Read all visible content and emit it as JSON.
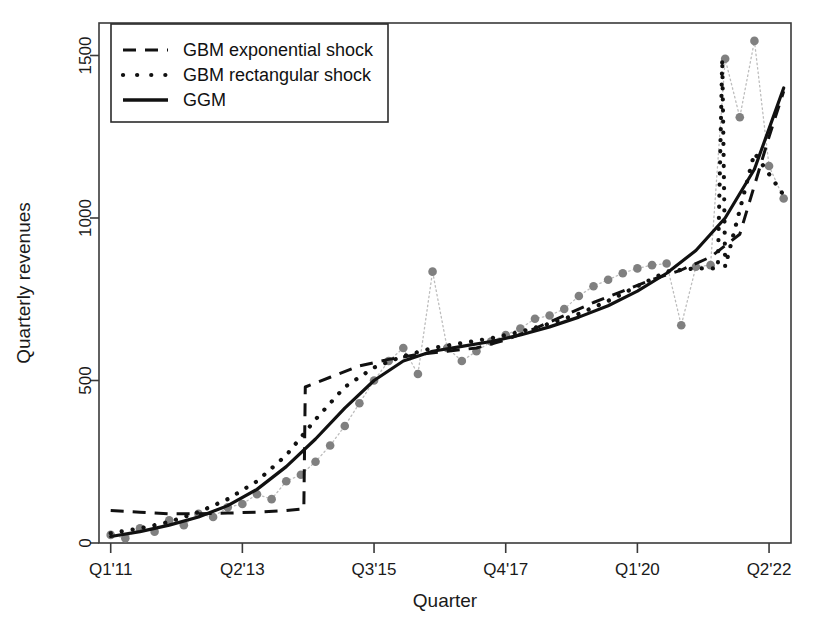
{
  "chart_data": {
    "type": "line",
    "title": "",
    "xlabel": "Quarter",
    "ylabel": "Quarterly revenues",
    "grid": false,
    "legend_position": "top-left",
    "ylim": [
      0,
      1600
    ],
    "yticks": [
      0,
      500,
      1000,
      1500
    ],
    "ytick_labels": [
      "0",
      "500",
      "1000",
      "1500"
    ],
    "xticks": [
      0,
      9,
      18,
      27,
      36,
      45
    ],
    "xtick_labels": [
      "Q1'11",
      "Q2'13",
      "Q3'15",
      "Q4'17",
      "Q1'20",
      "Q2'22"
    ],
    "xlim": [
      -0.8,
      46.5
    ],
    "legend": [
      {
        "label": "GBM exponential shock",
        "style": "dashed",
        "color": "#111111"
      },
      {
        "label": "GBM rectangular shock",
        "style": "dotted",
        "color": "#111111"
      },
      {
        "label": "GGM",
        "style": "solid",
        "color": "#111111"
      }
    ],
    "series": [
      {
        "name": "observed",
        "style": "points-dotted",
        "color": "#808080",
        "marker": "circle",
        "x": [
          0,
          1,
          2,
          3,
          4,
          5,
          6,
          7,
          8,
          9,
          10,
          11,
          12,
          13,
          14,
          15,
          16,
          17,
          18,
          19,
          20,
          21,
          22,
          23,
          24,
          25,
          26,
          27,
          28,
          29,
          30,
          31,
          32,
          33,
          34,
          35,
          36,
          37,
          38,
          39,
          40,
          41,
          42,
          43,
          44,
          45,
          46
        ],
        "values": [
          25,
          15,
          45,
          35,
          70,
          55,
          90,
          80,
          110,
          120,
          150,
          135,
          190,
          210,
          250,
          300,
          360,
          430,
          500,
          560,
          600,
          520,
          835,
          600,
          560,
          590,
          620,
          640,
          660,
          690,
          700,
          720,
          760,
          790,
          810,
          830,
          845,
          855,
          860,
          670,
          850,
          855,
          1490,
          1310,
          1545,
          1160,
          1060
        ]
      },
      {
        "name": "GGM",
        "style": "solid",
        "color": "#111111",
        "x": [
          0,
          2,
          4,
          6,
          8,
          10,
          12,
          14,
          16,
          18,
          20,
          22,
          24,
          26,
          28,
          30,
          32,
          34,
          36,
          38,
          40,
          42,
          44,
          46
        ],
        "values": [
          20,
          35,
          55,
          80,
          115,
          165,
          235,
          320,
          415,
          500,
          560,
          590,
          605,
          620,
          640,
          665,
          695,
          730,
          775,
          830,
          900,
          1000,
          1150,
          1400
        ]
      },
      {
        "name": "GBM exponential shock",
        "style": "dashed",
        "color": "#111111",
        "x": [
          0,
          2,
          4,
          6,
          8,
          10,
          12,
          13.2,
          13.3,
          15,
          17,
          19,
          21,
          23,
          25,
          27,
          29,
          31,
          33,
          35,
          37,
          39,
          41,
          43,
          45,
          46
        ],
        "values": [
          100,
          95,
          90,
          90,
          92,
          95,
          100,
          105,
          480,
          510,
          545,
          565,
          580,
          590,
          600,
          625,
          660,
          700,
          740,
          775,
          810,
          840,
          880,
          950,
          1250,
          1390
        ]
      },
      {
        "name": "GBM rectangular shock",
        "style": "dotted",
        "color": "#111111",
        "x": [
          0,
          2,
          4,
          6,
          8,
          10,
          12,
          14,
          16,
          18,
          20,
          22,
          24,
          26,
          28,
          30,
          32,
          34,
          36,
          38,
          40,
          41.5,
          41.8,
          42,
          44,
          46
        ],
        "values": [
          30,
          45,
          65,
          95,
          135,
          190,
          270,
          380,
          480,
          540,
          575,
          600,
          615,
          630,
          650,
          675,
          705,
          745,
          790,
          835,
          845,
          845,
          1490,
          850,
          1200,
          1070
        ]
      }
    ]
  },
  "axis": {
    "x_title": "Quarter",
    "y_title": "Quarterly revenues"
  }
}
